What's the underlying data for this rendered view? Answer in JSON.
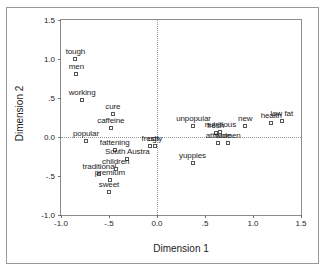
{
  "chart_data": {
    "type": "scatter",
    "title": "",
    "xlabel": "Dimension 1",
    "ylabel": "Dimension 2",
    "xlim": [
      -1.0,
      1.5
    ],
    "ylim": [
      -1.0,
      1.5
    ],
    "xticks": [
      -1.0,
      -0.5,
      0.0,
      0.5,
      1.0,
      1.5
    ],
    "xticklabels": [
      "-1.0",
      "-.5",
      "0.0",
      ".5",
      "1.0",
      "1.5"
    ],
    "yticks": [
      -1.0,
      -0.5,
      0.0,
      0.5,
      1.0,
      1.5
    ],
    "yticklabels": [
      "-1.0",
      "-.5",
      "0.0",
      ".5",
      "1.0",
      "1.5"
    ],
    "grid": false,
    "reference_lines": {
      "vertical_x": 0.0,
      "horizontal_y": 0.0
    },
    "legend": "none",
    "marker": "open-square",
    "points": [
      {
        "label": "tough",
        "x": -0.85,
        "y": 1.0
      },
      {
        "label": "men",
        "x": -0.84,
        "y": 0.81
      },
      {
        "label": "working",
        "x": -0.78,
        "y": 0.48
      },
      {
        "label": "cure",
        "x": -0.46,
        "y": 0.29
      },
      {
        "label": "caffeine",
        "x": -0.48,
        "y": 0.12
      },
      {
        "label": "popular",
        "x": -0.74,
        "y": -0.05
      },
      {
        "label": "fattening",
        "x": -0.44,
        "y": -0.17
      },
      {
        "label": "South Austra",
        "x": -0.31,
        "y": -0.28
      },
      {
        "label": "traditional",
        "x": -0.6,
        "y": -0.48
      },
      {
        "label": "children",
        "x": -0.43,
        "y": -0.41
      },
      {
        "label": "premium",
        "x": -0.49,
        "y": -0.55
      },
      {
        "label": "sweet",
        "x": -0.5,
        "y": -0.7
      },
      {
        "label": "fresh",
        "x": -0.07,
        "y": -0.11
      },
      {
        "label": "ugly",
        "x": -0.02,
        "y": -0.11
      },
      {
        "label": "unpopular",
        "x": 0.38,
        "y": 0.14
      },
      {
        "label": "fresh",
        "x": 0.61,
        "y": 0.05
      },
      {
        "label": "nutritious",
        "x": 0.66,
        "y": 0.07
      },
      {
        "label": "attitude",
        "x": 0.64,
        "y": -0.08
      },
      {
        "label": "women",
        "x": 0.74,
        "y": -0.08
      },
      {
        "label": "yuppies",
        "x": 0.37,
        "y": -0.33
      },
      {
        "label": "new",
        "x": 0.92,
        "y": 0.14
      },
      {
        "label": "health",
        "x": 1.19,
        "y": 0.18
      },
      {
        "label": "low fat",
        "x": 1.3,
        "y": 0.21
      }
    ]
  }
}
